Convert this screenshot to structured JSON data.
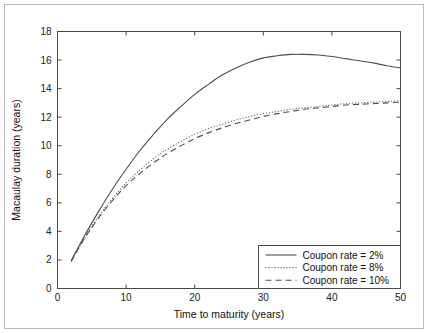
{
  "figure": {
    "border_color": "#b9b9b9",
    "background": "#ffffff"
  },
  "chart_data": {
    "type": "line",
    "title": "",
    "xlabel": "Time to maturity (years)",
    "ylabel": "Macaulay duration (years)",
    "xlim": [
      0,
      50
    ],
    "ylim": [
      0,
      18
    ],
    "xticks": [
      0,
      10,
      20,
      30,
      40,
      50
    ],
    "yticks": [
      0,
      2,
      4,
      6,
      8,
      10,
      12,
      14,
      16,
      18
    ],
    "xtick_labels": [
      "0",
      "10",
      "20",
      "30",
      "40",
      "50"
    ],
    "ytick_labels": [
      "0",
      "2",
      "4",
      "6",
      "8",
      "10",
      "12",
      "14",
      "16",
      "18"
    ],
    "grid": false,
    "legend_position": "lower right",
    "axis_color": "#4a4a4a",
    "line_color": "#4d4d4d",
    "x": [
      2,
      4,
      6,
      8,
      10,
      12,
      14,
      16,
      18,
      20,
      22,
      24,
      26,
      28,
      30,
      32,
      34,
      36,
      38,
      40,
      42,
      44,
      46,
      48,
      50
    ],
    "series": [
      {
        "name": "Coupon rate = 2%",
        "style": "solid",
        "dasharray": "",
        "values": [
          1.95,
          3.75,
          5.4,
          6.95,
          8.35,
          9.65,
          10.8,
          11.85,
          12.75,
          13.6,
          14.3,
          14.95,
          15.45,
          15.85,
          16.15,
          16.3,
          16.4,
          16.4,
          16.35,
          16.25,
          16.1,
          15.95,
          15.8,
          15.6,
          15.45
        ]
      },
      {
        "name": "Coupon rate = 8%",
        "style": "dotted",
        "dasharray": "1,2",
        "values": [
          1.9,
          3.6,
          5.05,
          6.3,
          7.4,
          8.3,
          9.1,
          9.75,
          10.3,
          10.8,
          11.2,
          11.5,
          11.8,
          12.05,
          12.25,
          12.4,
          12.55,
          12.65,
          12.75,
          12.85,
          12.95,
          13.0,
          13.05,
          13.1,
          13.15
        ]
      },
      {
        "name": "Coupon rate = 10%",
        "style": "dashed",
        "dasharray": "6,4",
        "values": [
          1.9,
          3.55,
          4.95,
          6.15,
          7.2,
          8.05,
          8.8,
          9.45,
          10.0,
          10.5,
          10.9,
          11.25,
          11.55,
          11.8,
          12.05,
          12.25,
          12.4,
          12.55,
          12.65,
          12.75,
          12.85,
          12.9,
          12.95,
          13.0,
          13.05
        ]
      }
    ]
  },
  "legend": {
    "entries": [
      {
        "label": "Coupon rate = 2%",
        "style": "solid"
      },
      {
        "label": "Coupon rate = 8%",
        "style": "dotted"
      },
      {
        "label": "Coupon rate = 10%",
        "style": "dashed"
      }
    ]
  }
}
